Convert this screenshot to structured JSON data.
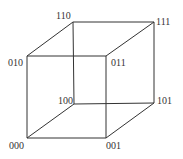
{
  "diagram": {
    "type": "cube",
    "colors": {
      "edge": "#333333",
      "label": "#333333",
      "background": "#ffffff"
    },
    "vertices": [
      {
        "id": "000",
        "label": "000",
        "x": 27,
        "y": 138,
        "lx": 9,
        "ly": 149
      },
      {
        "id": "001",
        "label": "001",
        "x": 106,
        "y": 138,
        "lx": 106,
        "ly": 149
      },
      {
        "id": "010",
        "label": "010",
        "x": 27,
        "y": 56,
        "lx": 8,
        "ly": 66
      },
      {
        "id": "011",
        "label": "011",
        "x": 106,
        "y": 56,
        "lx": 111,
        "ly": 66
      },
      {
        "id": "100",
        "label": "100",
        "x": 74,
        "y": 104,
        "lx": 58,
        "ly": 104
      },
      {
        "id": "101",
        "label": "101",
        "x": 154,
        "y": 103,
        "lx": 157,
        "ly": 104
      },
      {
        "id": "110",
        "label": "110",
        "x": 73,
        "y": 22,
        "lx": 56,
        "ly": 19
      },
      {
        "id": "111",
        "label": "111",
        "x": 154,
        "y": 22,
        "lx": 156,
        "ly": 25
      }
    ],
    "edges": [
      [
        "000",
        "001"
      ],
      [
        "000",
        "010"
      ],
      [
        "000",
        "100"
      ],
      [
        "001",
        "011"
      ],
      [
        "001",
        "101"
      ],
      [
        "010",
        "011"
      ],
      [
        "010",
        "110"
      ],
      [
        "011",
        "111"
      ],
      [
        "100",
        "101"
      ],
      [
        "100",
        "110"
      ],
      [
        "101",
        "111"
      ],
      [
        "110",
        "111"
      ]
    ]
  }
}
